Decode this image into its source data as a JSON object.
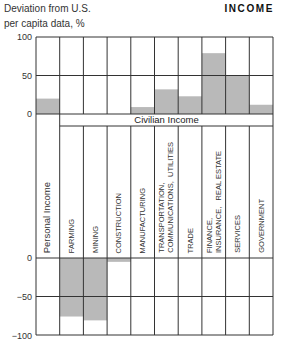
{
  "header": {
    "subtitle_line1": "Deviation from U.S.",
    "subtitle_line2": "per capita data, %",
    "title": "INCOME"
  },
  "group_label": "Civilian Income",
  "colors": {
    "bar": "#b9b9b9",
    "grid": "#333333"
  },
  "chart_data": {
    "type": "bar",
    "title": "INCOME",
    "ylabel": "Deviation from U.S. per capita data, %",
    "xlabel": "",
    "ylim": [
      -100,
      100
    ],
    "yticks_top": [
      100,
      50,
      0
    ],
    "yticks_bottom": [
      0,
      -50,
      -100
    ],
    "grid": true,
    "legend": null,
    "annotations": [
      "Civilian Income (group spanning Farming through Government)"
    ],
    "categories": [
      "Personal Income",
      "FARMING",
      "MINING",
      "CONSTRUCTION",
      "MANUFACTURING",
      "TRANSPORTATION, COMMUNICATIONS, UTILITIES",
      "TRADE",
      "FINANCE, INSURANCE, REAL ESTATE",
      "SERVICES",
      "GOVERNMENT"
    ],
    "values": [
      20,
      -76,
      -81,
      -5,
      9,
      32,
      23,
      79,
      50,
      12
    ]
  },
  "labels": [
    "Personal Income",
    "FARMING",
    "MINING",
    "CONSTRUCTION",
    "MANUFACTURING",
    "TRANSPORTATION,\nCOMMUNICATIONS,  UTILITIES",
    "TRADE",
    "FINANCE,\nINSURANCE,   REAL ESTATE",
    "SERVICES",
    "GOVERNMENT"
  ],
  "ticks": {
    "t100": "100",
    "t50": "50",
    "t0": "0",
    "b0": "0",
    "bm50": "−50",
    "bm100": "−100"
  }
}
